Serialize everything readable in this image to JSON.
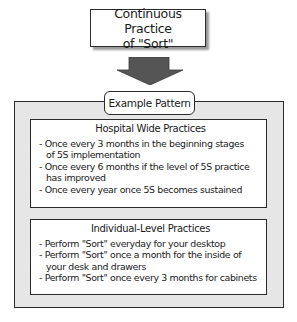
{
  "top_box": {
    "line1": "Continuous Practice",
    "line2": "of \"Sort\""
  },
  "arrow": {
    "icon": "down-arrow-icon",
    "color": "#555555"
  },
  "example_label": "Example Pattern",
  "sections": {
    "hospital": {
      "title": "Hospital Wide Practices",
      "items": [
        {
          "line1": "- Once every 3 months in the beginning stages",
          "line2": "of 5S implementation"
        },
        {
          "line1": "- Once every 6 months if the level of 5S practice",
          "line2": "has improved"
        },
        {
          "line1": "- Once every year once 5S becomes sustained"
        }
      ]
    },
    "individual": {
      "title": "Individual-Level Practices",
      "items": [
        {
          "line1": "- Perform \"Sort\" everyday for your desktop"
        },
        {
          "line1": "- Perform \"Sort\" once a month for the inside of",
          "line2": "your desk and drawers"
        },
        {
          "line1": "- Perform \"Sort\" once every 3 months for cabinets"
        }
      ]
    }
  },
  "colors": {
    "panel_bg": "#e6e6e6",
    "border": "#2b2b2b",
    "arrow": "#555555"
  }
}
